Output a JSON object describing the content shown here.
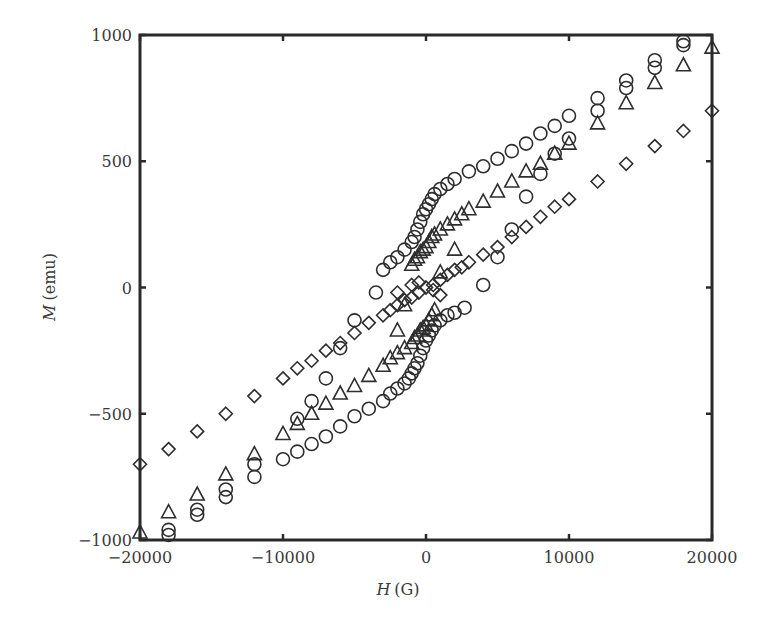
{
  "chart_data": {
    "type": "scatter",
    "title": "",
    "xlabel": "H (G)",
    "xlabel_var": "H",
    "xlabel_unit": "(G)",
    "ylabel": "M (emu)",
    "ylabel_var": "M",
    "ylabel_unit": "(emu)",
    "xlim": [
      -20000,
      20000
    ],
    "ylim": [
      -1000,
      1000
    ],
    "xticks": [
      -20000,
      -10000,
      0,
      10000,
      20000
    ],
    "xtick_labels": [
      "−20000",
      "−10000",
      "0",
      "10000",
      "20000"
    ],
    "yticks": [
      -1000,
      -500,
      0,
      500,
      1000
    ],
    "ytick_labels": [
      "−1000",
      "−500",
      "0",
      "500",
      "1000"
    ],
    "grid": false,
    "legend": "none",
    "series": [
      {
        "name": "circles",
        "marker": "circle",
        "points": [
          [
            -18000,
            -960
          ],
          [
            -18000,
            -980
          ],
          [
            -16000,
            -880
          ],
          [
            -16000,
            -900
          ],
          [
            -14000,
            -800
          ],
          [
            -14000,
            -830
          ],
          [
            -12000,
            -700
          ],
          [
            -12000,
            -750
          ],
          [
            -10000,
            -680
          ],
          [
            -9000,
            -650
          ],
          [
            -8000,
            -620
          ],
          [
            -7000,
            -590
          ],
          [
            -6000,
            -550
          ],
          [
            -5000,
            -510
          ],
          [
            -4000,
            -480
          ],
          [
            -3000,
            -450
          ],
          [
            -2500,
            -420
          ],
          [
            -2000,
            -400
          ],
          [
            -1500,
            -380
          ],
          [
            -1200,
            -360
          ],
          [
            -1000,
            -340
          ],
          [
            -800,
            -320
          ],
          [
            -600,
            -300
          ],
          [
            -400,
            -270
          ],
          [
            -200,
            -240
          ],
          [
            0,
            -210
          ],
          [
            200,
            -190
          ],
          [
            400,
            -170
          ],
          [
            600,
            -150
          ],
          [
            1000,
            -130
          ],
          [
            1500,
            -110
          ],
          [
            2000,
            -100
          ],
          [
            2700,
            -80
          ],
          [
            -9000,
            -520
          ],
          [
            -8000,
            -450
          ],
          [
            -7000,
            -360
          ],
          [
            -6000,
            -240
          ],
          [
            -5000,
            -130
          ],
          [
            -3500,
            -20
          ],
          [
            -3000,
            70
          ],
          [
            -2500,
            100
          ],
          [
            -2000,
            120
          ],
          [
            -1500,
            150
          ],
          [
            -1000,
            180
          ],
          [
            -800,
            200
          ],
          [
            -600,
            230
          ],
          [
            -400,
            260
          ],
          [
            -200,
            290
          ],
          [
            0,
            310
          ],
          [
            200,
            330
          ],
          [
            400,
            350
          ],
          [
            600,
            370
          ],
          [
            1000,
            390
          ],
          [
            1500,
            410
          ],
          [
            2000,
            430
          ],
          [
            3000,
            460
          ],
          [
            4000,
            480
          ],
          [
            5000,
            510
          ],
          [
            6000,
            540
          ],
          [
            7000,
            570
          ],
          [
            8000,
            610
          ],
          [
            9000,
            640
          ],
          [
            10000,
            680
          ],
          [
            12000,
            700
          ],
          [
            12000,
            750
          ],
          [
            14000,
            790
          ],
          [
            14000,
            820
          ],
          [
            16000,
            870
          ],
          [
            16000,
            900
          ],
          [
            18000,
            960
          ],
          [
            18000,
            975
          ],
          [
            4000,
            10
          ],
          [
            5000,
            120
          ],
          [
            6000,
            230
          ],
          [
            7000,
            360
          ],
          [
            8000,
            450
          ],
          [
            9000,
            530
          ],
          [
            10000,
            590
          ]
        ]
      },
      {
        "name": "triangles",
        "marker": "triangle",
        "points": [
          [
            -20000,
            -970
          ],
          [
            -18000,
            -890
          ],
          [
            -16000,
            -820
          ],
          [
            -14000,
            -740
          ],
          [
            -12000,
            -660
          ],
          [
            -10000,
            -580
          ],
          [
            -9000,
            -540
          ],
          [
            -8000,
            -500
          ],
          [
            -7000,
            -460
          ],
          [
            -6000,
            -420
          ],
          [
            -5000,
            -390
          ],
          [
            -4000,
            -350
          ],
          [
            -3000,
            -310
          ],
          [
            -2500,
            -280
          ],
          [
            -2000,
            -260
          ],
          [
            -1500,
            -240
          ],
          [
            -1000,
            -220
          ],
          [
            -800,
            -200
          ],
          [
            -600,
            -190
          ],
          [
            -400,
            -170
          ],
          [
            -200,
            -160
          ],
          [
            0,
            -150
          ],
          [
            200,
            -130
          ],
          [
            400,
            -110
          ],
          [
            600,
            -90
          ],
          [
            -2000,
            -170
          ],
          [
            -1500,
            -70
          ],
          [
            -1000,
            90
          ],
          [
            -800,
            110
          ],
          [
            -600,
            120
          ],
          [
            -400,
            140
          ],
          [
            -200,
            150
          ],
          [
            0,
            160
          ],
          [
            200,
            180
          ],
          [
            400,
            200
          ],
          [
            600,
            210
          ],
          [
            1000,
            230
          ],
          [
            1500,
            250
          ],
          [
            2000,
            270
          ],
          [
            2500,
            290
          ],
          [
            3000,
            310
          ],
          [
            4000,
            340
          ],
          [
            5000,
            380
          ],
          [
            6000,
            420
          ],
          [
            7000,
            460
          ],
          [
            8000,
            490
          ],
          [
            9000,
            530
          ],
          [
            10000,
            570
          ],
          [
            12000,
            650
          ],
          [
            14000,
            730
          ],
          [
            16000,
            810
          ],
          [
            18000,
            880
          ],
          [
            20000,
            950
          ],
          [
            2000,
            150
          ],
          [
            1000,
            60
          ]
        ]
      },
      {
        "name": "diamonds",
        "marker": "diamond",
        "points": [
          [
            -20000,
            -700
          ],
          [
            -18000,
            -640
          ],
          [
            -16000,
            -570
          ],
          [
            -14000,
            -500
          ],
          [
            -12000,
            -430
          ],
          [
            -10000,
            -360
          ],
          [
            -9000,
            -320
          ],
          [
            -8000,
            -290
          ],
          [
            -7000,
            -250
          ],
          [
            -6000,
            -220
          ],
          [
            -5000,
            -180
          ],
          [
            -4000,
            -140
          ],
          [
            -3000,
            -110
          ],
          [
            -2500,
            -90
          ],
          [
            -2000,
            -70
          ],
          [
            -1500,
            -50
          ],
          [
            -1000,
            -40
          ],
          [
            -500,
            -20
          ],
          [
            0,
            0
          ],
          [
            500,
            10
          ],
          [
            1000,
            30
          ],
          [
            1500,
            50
          ],
          [
            2000,
            70
          ],
          [
            2500,
            80
          ],
          [
            3000,
            100
          ],
          [
            4000,
            130
          ],
          [
            5000,
            160
          ],
          [
            6000,
            200
          ],
          [
            7000,
            240
          ],
          [
            8000,
            280
          ],
          [
            9000,
            320
          ],
          [
            10000,
            350
          ],
          [
            12000,
            420
          ],
          [
            14000,
            490
          ],
          [
            16000,
            560
          ],
          [
            18000,
            620
          ],
          [
            20000,
            700
          ],
          [
            -2000,
            -20
          ],
          [
            -1000,
            10
          ],
          [
            -500,
            20
          ],
          [
            500,
            -10
          ],
          [
            1000,
            -30
          ]
        ]
      }
    ]
  }
}
